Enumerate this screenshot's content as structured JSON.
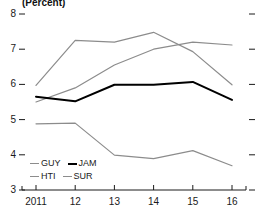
{
  "chart_data": {
    "type": "line",
    "title": "(Percent)",
    "xlabel": "",
    "ylabel": "",
    "categories": [
      "2011",
      "12",
      "13",
      "14",
      "15",
      "16"
    ],
    "x": [
      2011,
      2012,
      2013,
      2014,
      2015,
      2016
    ],
    "ylim": [
      3,
      8
    ],
    "yticks": [
      3,
      4,
      5,
      6,
      7,
      8
    ],
    "ytick_labels": [
      "3",
      "4",
      "5",
      "6",
      "7",
      "8"
    ],
    "grid": false,
    "legend_position": "bottom-left",
    "series": [
      {
        "name": "GUY",
        "color": "#8c8c8c",
        "width": 1.2,
        "values": [
          5.5,
          5.9,
          6.55,
          7.0,
          7.2,
          7.12
        ]
      },
      {
        "name": "JAM",
        "color": "#000000",
        "width": 2.0,
        "values": [
          5.65,
          5.52,
          5.99,
          5.99,
          6.07,
          5.56
        ]
      },
      {
        "name": "HTI",
        "color": "#8c8c8c",
        "width": 1.2,
        "values": [
          5.97,
          7.25,
          7.2,
          7.48,
          6.93,
          5.99
        ]
      },
      {
        "name": "SUR",
        "color": "#8c8c8c",
        "width": 1.2,
        "values": [
          4.88,
          4.9,
          3.99,
          3.89,
          4.12,
          3.69
        ]
      }
    ],
    "annotations": {
      "crossover_note": "HTI peaks at 2014 then declines; GUY rises steadily crossing HTI near 2015"
    }
  },
  "legend": {
    "rows": [
      [
        {
          "name": "GUY",
          "color": "#8c8c8c",
          "width": 1.2
        },
        {
          "name": "JAM",
          "color": "#000000",
          "width": 2.0
        }
      ],
      [
        {
          "name": "HTI",
          "color": "#8c8c8c",
          "width": 1.2
        },
        {
          "name": "SUR",
          "color": "#8c8c8c",
          "width": 1.2
        }
      ]
    ]
  },
  "axis_style": {
    "axis_color": "#1a1a1a",
    "tick_color": "#1a1a1a",
    "right_tick_color": "#1a1a1a"
  }
}
